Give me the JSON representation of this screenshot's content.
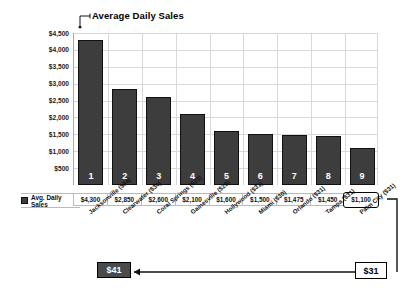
{
  "chart_data": {
    "type": "bar",
    "title": "Average Daily Sales",
    "xlabel": "",
    "ylabel": "",
    "ylim": [
      0,
      4500
    ],
    "grid": true,
    "legend_position": "bottom-table",
    "legend_entries": [
      "Avg. Daily Sales"
    ],
    "categories": [
      "Jacksonville ($34)",
      "Clearwater ($34)",
      "Coral Springs ($23)",
      "Gainesville ($23)",
      "Hollywood ($31)",
      "Miami ($30)",
      "Orlando ($31)",
      "Tampa ($31)",
      "Palm City ($31)"
    ],
    "bar_numbers": [
      "1",
      "2",
      "3",
      "4",
      "5",
      "6",
      "7",
      "8",
      "9"
    ],
    "values": [
      4300,
      2850,
      2600,
      2100,
      1600,
      1500,
      1475,
      1450,
      1100
    ],
    "value_labels": [
      "$4,300",
      "$2,850",
      "$2,600",
      "$2,100",
      "$1,600",
      "$1,500",
      "$1,475",
      "$1,450",
      "$1,100"
    ],
    "ytick_labels": [
      "$4,500",
      "$4,000",
      "$3,500",
      "$3,000",
      "$2,500",
      "$2,000",
      "$1,500",
      "$1,000",
      "$500"
    ],
    "ytick_values": [
      4500,
      4000,
      3500,
      3000,
      2500,
      2000,
      1500,
      1000,
      500
    ],
    "series": [
      {
        "name": "Avg. Daily Sales",
        "values": [
          4300,
          2850,
          2600,
          2100,
          1600,
          1500,
          1475,
          1450,
          1100
        ]
      }
    ],
    "annotations": [
      {
        "name": "highlighted-value",
        "text": "$1,100"
      },
      {
        "name": "callout-left",
        "text": "$41"
      },
      {
        "name": "callout-right",
        "text": "$31"
      }
    ]
  },
  "table": {
    "row_label": "Avg. Daily Sales",
    "values": [
      "$4,300",
      "$2,850",
      "$2,600",
      "$2,100",
      "$1,600",
      "$1,500",
      "$1,475",
      "$1,450",
      "$1,100"
    ]
  },
  "callouts": {
    "left_label": "$41",
    "right_label": "$31"
  },
  "colors": {
    "bar_fill": "#3d3d3d",
    "bar_stroke": "#111111",
    "grid": "#d8d8d8",
    "axis": "#a8a8a8",
    "callout_left_bg": "#4a4a4a",
    "callout_left_text": "#ffffff",
    "callout_right_bg": "#ffffff",
    "callout_right_text": "#000000"
  }
}
